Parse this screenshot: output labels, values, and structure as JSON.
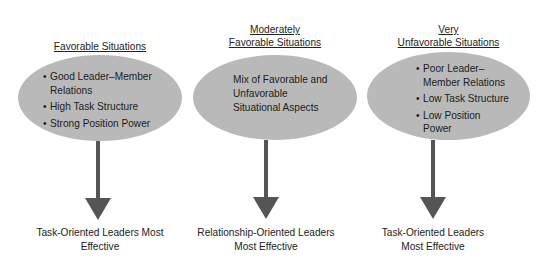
{
  "colors": {
    "ellipse_fill": "#b9b9b9",
    "arrow": "#555555",
    "text": "#222222"
  },
  "columns": [
    {
      "heading_lines": [
        "Favorable Situations"
      ],
      "ellipse_style": "bullets",
      "items": [
        "Good Leader–Member Relations",
        "High Task Structure",
        "Strong Position Power"
      ],
      "outcome_lines": [
        "Task-Oriented Leaders Most",
        "Effective"
      ]
    },
    {
      "heading_lines": [
        "Moderately",
        "Favorable Situations"
      ],
      "ellipse_style": "paragraph",
      "text_lines": [
        "Mix of Favorable and",
        "Unfavorable",
        "Situational Aspects"
      ],
      "outcome_lines": [
        "Relationship-Oriented Leaders",
        "Most Effective"
      ]
    },
    {
      "heading_lines": [
        "Very",
        "Unfavorable Situations"
      ],
      "ellipse_style": "bullets",
      "items": [
        "Poor Leader– Member Relations",
        "Low Task Structure",
        "Low Position Power"
      ],
      "outcome_lines": [
        "Task-Oriented Leaders",
        "Most Effective"
      ]
    }
  ],
  "render_lines": {
    "c1_items": [
      "Good Leader–Member",
      "Relations",
      "High Task Structure",
      "Strong Position Power"
    ],
    "c3_items": [
      "Poor Leader–",
      "Member Relations",
      "Low Task Structure",
      "Low Position",
      "Power"
    ]
  }
}
